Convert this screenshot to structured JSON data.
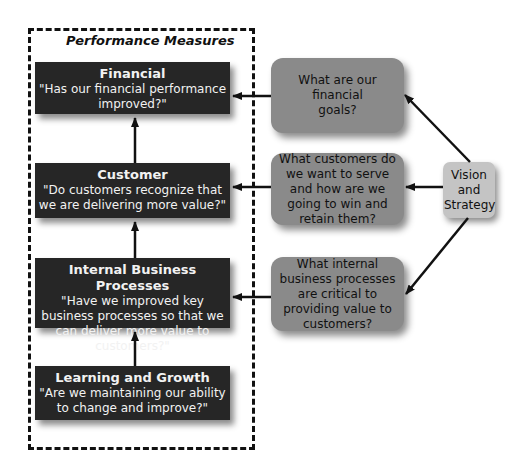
{
  "frame": {
    "title": "Performance Measures"
  },
  "measures": [
    {
      "title": "Financial",
      "question": "\"Has our financial performance improved?\""
    },
    {
      "title": "Customer",
      "question": "\"Do customers recognize that we are delivering more value?\""
    },
    {
      "title": "Internal Business Processes",
      "question": "\"Have we improved key business processes so that we can deliver more value to customers?\""
    },
    {
      "title": "Learning and Growth",
      "question": "\"Are we maintaining our ability to change and improve?\""
    }
  ],
  "goals": [
    {
      "text": "What are our financial goals?"
    },
    {
      "text": "What customers do we want to serve and how are we going to win and retain them?"
    },
    {
      "text": "What internal business processes are critical to providing value to customers?"
    }
  ],
  "vision": {
    "text": "Vision and Strategy"
  },
  "colors": {
    "measure_box": "#262626",
    "goal_box": "#8a8a8a",
    "vision_box": "#c4c4c4",
    "frame": "#111111"
  }
}
